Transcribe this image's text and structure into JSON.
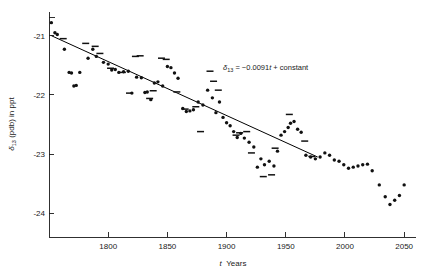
{
  "chart_data": {
    "type": "scatter",
    "title": "",
    "xlabel": "t   Years",
    "xlabel_symbol": "t",
    "xlabel_unit": "Years",
    "ylabel": "δ₁₃ (pdb) in ppt",
    "ylabel_symbol": "δ",
    "ylabel_subscript": "13",
    "ylabel_rest": " (pdb) in ppt",
    "xlim": [
      1750,
      2060
    ],
    "ylim": [
      -24.4,
      -20.6
    ],
    "xticks": [
      1800,
      1850,
      1900,
      1950,
      2000,
      2050
    ],
    "xtick_labels": [
      "1800",
      "1850",
      "1900",
      "1950",
      "2000",
      "2050"
    ],
    "yticks": [
      -21,
      -22,
      -23,
      -24
    ],
    "ytick_labels": [
      "-21",
      "-22",
      "-23",
      "-24"
    ],
    "grid": false,
    "legend": null,
    "annotation": {
      "text": "δ₁₃ = −0.0091t + constant",
      "symbol": "δ",
      "subscript": "13",
      "equals": " = ",
      "slope": "−0.0091",
      "variable": "t",
      "plus_constant": " + constant",
      "x": 1935,
      "y": -21.5
    },
    "fit_line": {
      "slope_per_year": -0.0091,
      "x_start": 1752,
      "y_start": -21.0,
      "x_end": 1977,
      "y_end": -23.05
    },
    "colors": {
      "axis": "#1a1a1a",
      "marker": "#111111",
      "fit_line": "#000000",
      "background": "#ffffff"
    },
    "series": [
      {
        "name": "dot-markers",
        "marker": "filled-circle",
        "points": [
          [
            1752,
            -20.78
          ],
          [
            1755,
            -20.95
          ],
          [
            1757,
            -20.98
          ],
          [
            1763,
            -21.23
          ],
          [
            1767,
            -21.62
          ],
          [
            1769,
            -21.63
          ],
          [
            1771,
            -21.85
          ],
          [
            1773,
            -21.84
          ],
          [
            1776,
            -21.62
          ],
          [
            1783,
            -21.38
          ],
          [
            1787,
            -21.23
          ],
          [
            1790,
            -21.35
          ],
          [
            1796,
            -21.45
          ],
          [
            1800,
            -21.48
          ],
          [
            1803,
            -21.58
          ],
          [
            1806,
            -21.57
          ],
          [
            1809,
            -21.62
          ],
          [
            1813,
            -21.61
          ],
          [
            1817,
            -21.6
          ],
          [
            1820,
            -21.97
          ],
          [
            1824,
            -21.7
          ],
          [
            1828,
            -21.71
          ],
          [
            1831,
            -21.96
          ],
          [
            1833,
            -21.95
          ],
          [
            1836,
            -22.08
          ],
          [
            1839,
            -21.8
          ],
          [
            1842,
            -21.78
          ],
          [
            1846,
            -21.85
          ],
          [
            1850,
            -21.52
          ],
          [
            1853,
            -21.54
          ],
          [
            1856,
            -21.63
          ],
          [
            1859,
            -21.72
          ],
          [
            1863,
            -22.23
          ],
          [
            1866,
            -22.28
          ],
          [
            1869,
            -22.27
          ],
          [
            1872,
            -22.25
          ],
          [
            1876,
            -22.12
          ],
          [
            1880,
            -22.17
          ],
          [
            1884,
            -21.92
          ],
          [
            1888,
            -22.05
          ],
          [
            1891,
            -22.3
          ],
          [
            1894,
            -22.12
          ],
          [
            1897,
            -22.38
          ],
          [
            1900,
            -22.47
          ],
          [
            1903,
            -22.52
          ],
          [
            1906,
            -22.62
          ],
          [
            1909,
            -22.72
          ],
          [
            1912,
            -22.65
          ],
          [
            1915,
            -22.73
          ],
          [
            1919,
            -22.8
          ],
          [
            1923,
            -22.88
          ],
          [
            1926,
            -23.22
          ],
          [
            1929,
            -23.08
          ],
          [
            1932,
            -23.18
          ],
          [
            1936,
            -23.12
          ],
          [
            1940,
            -23.2
          ],
          [
            1943,
            -22.95
          ],
          [
            1946,
            -22.68
          ],
          [
            1949,
            -22.62
          ],
          [
            1952,
            -22.55
          ],
          [
            1954,
            -22.48
          ],
          [
            1957,
            -22.45
          ],
          [
            1960,
            -22.58
          ],
          [
            1963,
            -22.63
          ],
          [
            1967,
            -23.02
          ],
          [
            1971,
            -23.05
          ],
          [
            1975,
            -23.08
          ],
          [
            1979,
            -23.05
          ],
          [
            1983,
            -22.98
          ],
          [
            1987,
            -23.02
          ],
          [
            1991,
            -23.1
          ],
          [
            1995,
            -23.12
          ],
          [
            1999,
            -23.18
          ],
          [
            2003,
            -23.24
          ],
          [
            2007,
            -23.22
          ],
          [
            2011,
            -23.2
          ],
          [
            2015,
            -23.18
          ],
          [
            2019,
            -23.17
          ],
          [
            2023,
            -23.28
          ],
          [
            2029,
            -23.52
          ],
          [
            2034,
            -23.72
          ],
          [
            2038,
            -23.85
          ],
          [
            2042,
            -23.78
          ],
          [
            2046,
            -23.7
          ],
          [
            2050,
            -23.52
          ]
        ]
      },
      {
        "name": "dash-markers",
        "marker": "horizontal-dash",
        "points": [
          [
            1762,
            -21.05
          ],
          [
            1781,
            -21.13
          ],
          [
            1789,
            -21.18
          ],
          [
            1793,
            -21.3
          ],
          [
            1802,
            -21.55
          ],
          [
            1812,
            -21.62
          ],
          [
            1818,
            -21.97
          ],
          [
            1823,
            -21.35
          ],
          [
            1827,
            -21.34
          ],
          [
            1835,
            -22.06
          ],
          [
            1838,
            -21.93
          ],
          [
            1845,
            -21.38
          ],
          [
            1849,
            -21.4
          ],
          [
            1858,
            -21.95
          ],
          [
            1865,
            -22.24
          ],
          [
            1874,
            -22.2
          ],
          [
            1878,
            -22.62
          ],
          [
            1886,
            -21.6
          ],
          [
            1889,
            -21.77
          ],
          [
            1893,
            -21.92
          ],
          [
            1908,
            -22.68
          ],
          [
            1911,
            -22.64
          ],
          [
            1917,
            -22.62
          ],
          [
            1921,
            -22.98
          ],
          [
            1931,
            -23.38
          ],
          [
            1938,
            -23.35
          ],
          [
            1941,
            -22.9
          ],
          [
            1953,
            -22.33
          ],
          [
            1966,
            -22.78
          ],
          [
            1972,
            -23.04
          ]
        ]
      }
    ]
  }
}
